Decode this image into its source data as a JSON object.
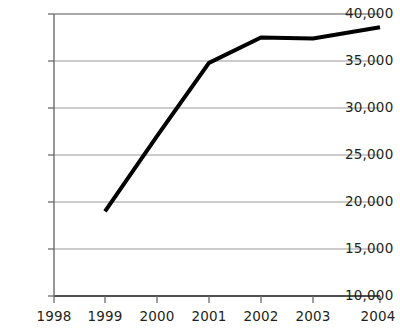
{
  "chart_data": {
    "type": "line",
    "title": "",
    "subtitle": "",
    "xlabel": "",
    "ylabel": "",
    "categories": [
      "1998",
      "1999",
      "2000",
      "2001",
      "2002",
      "2003",
      "2004"
    ],
    "x": [
      1998,
      1999,
      2000,
      2001,
      2002,
      2003,
      2004
    ],
    "values": [
      null,
      19000,
      27000,
      34800,
      37500,
      37400,
      38600
    ],
    "series": [
      {
        "name": "",
        "values": [
          null,
          19000,
          27000,
          34800,
          37500,
          37400,
          38600
        ]
      }
    ],
    "xlim": [
      1998,
      2004
    ],
    "ylim": [
      10000,
      40000
    ],
    "ytick_values": [
      10000,
      15000,
      20000,
      25000,
      30000,
      35000,
      40000
    ],
    "ytick_labels": [
      "10,000",
      "15,000",
      "20,000",
      "25,000",
      "30,000",
      "35,000",
      "40,000"
    ],
    "xtick_labels": [
      "1998",
      "1999",
      "2000",
      "2001",
      "2002",
      "2003",
      "2004"
    ],
    "grid": true,
    "grid_axis": "y",
    "legend": false,
    "legend_position": "none",
    "annotations": [],
    "line_color": "#000000",
    "line_width": 4,
    "grid_color": "#9a9a9a",
    "axis_color": "#555555",
    "background_color": "#ffffff",
    "text_color": "#231f20",
    "note": "Series begins at 1999; no data plotted at 1998."
  },
  "layout": {
    "plot_left": 54,
    "plot_right": 380,
    "plot_top": 14,
    "plot_bottom": 296
  }
}
